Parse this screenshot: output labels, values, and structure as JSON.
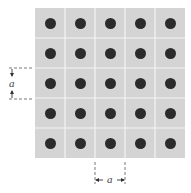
{
  "diagram": {
    "type": "square-lattice",
    "rows": 5,
    "cols": 5,
    "colors": {
      "cell": "#d4d4d4",
      "grid_line": "#f4f4f4",
      "atom": "#2b2b2b",
      "annotation": "#555555"
    },
    "labels": {
      "vertical_spacing": "a",
      "horizontal_spacing": "a"
    }
  }
}
